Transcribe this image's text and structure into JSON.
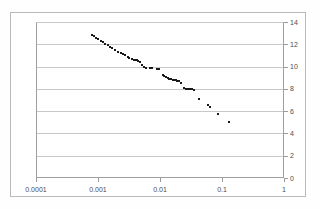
{
  "chart_data": {
    "type": "scatter",
    "title": "",
    "subtitle": "",
    "xlabel": "",
    "ylabel": "",
    "xscale": "log",
    "yscale": "linear",
    "xlim": [
      0.0001,
      1
    ],
    "ylim": [
      0,
      14
    ],
    "grid": "horizontal",
    "legend": null,
    "y_axis_position": "right",
    "x_tick_labels": [
      "0.0001",
      "0.001",
      "0.01",
      "0.1",
      "1"
    ],
    "x_tick_values": [
      0.0001,
      0.001,
      0.01,
      0.1,
      1
    ],
    "y_tick_labels": [
      "0",
      "2",
      "4",
      "6",
      "8",
      "10",
      "12",
      "14"
    ],
    "y_tick_values": [
      0,
      2,
      4,
      6,
      8,
      10,
      12,
      14
    ],
    "marker": {
      "shape": "square",
      "color": "#1a1a1a",
      "size": 2
    },
    "series": [
      {
        "name": "series-1",
        "points": [
          [
            0.00079,
            12.85
          ],
          [
            0.00085,
            12.7
          ],
          [
            0.00093,
            12.55
          ],
          [
            0.001,
            12.45
          ],
          [
            0.0011,
            12.3
          ],
          [
            0.00122,
            12.2
          ],
          [
            0.00132,
            12.05
          ],
          [
            0.00145,
            11.95
          ],
          [
            0.00158,
            11.8
          ],
          [
            0.0017,
            11.7
          ],
          [
            0.0019,
            11.45
          ],
          [
            0.0021,
            11.3
          ],
          [
            0.00232,
            11.2
          ],
          [
            0.0025,
            11.15
          ],
          [
            0.00275,
            11.05
          ],
          [
            0.003,
            10.9
          ],
          [
            0.0032,
            10.75
          ],
          [
            0.00355,
            10.7
          ],
          [
            0.0038,
            10.6
          ],
          [
            0.004,
            10.6
          ],
          [
            0.0042,
            10.55
          ],
          [
            0.0045,
            10.5
          ],
          [
            0.0048,
            10.45
          ],
          [
            0.0052,
            10.1
          ],
          [
            0.0056,
            9.95
          ],
          [
            0.006,
            9.9
          ],
          [
            0.0068,
            9.85
          ],
          [
            0.0074,
            9.85
          ],
          [
            0.0088,
            9.8
          ],
          [
            0.0095,
            9.75
          ],
          [
            0.011,
            9.2
          ],
          [
            0.0118,
            9.15
          ],
          [
            0.0125,
            9.05
          ],
          [
            0.0133,
            9.0
          ],
          [
            0.0142,
            8.9
          ],
          [
            0.015,
            8.85
          ],
          [
            0.0162,
            8.8
          ],
          [
            0.017,
            8.8
          ],
          [
            0.018,
            8.8
          ],
          [
            0.019,
            8.75
          ],
          [
            0.0205,
            8.7
          ],
          [
            0.022,
            8.55
          ],
          [
            0.0245,
            8.1
          ],
          [
            0.026,
            8.0
          ],
          [
            0.028,
            7.95
          ],
          [
            0.0295,
            7.95
          ],
          [
            0.031,
            7.95
          ],
          [
            0.033,
            7.95
          ],
          [
            0.035,
            7.9
          ],
          [
            0.042,
            7.05
          ],
          [
            0.06,
            6.55
          ],
          [
            0.063,
            6.4
          ],
          [
            0.085,
            5.75
          ],
          [
            0.13,
            5.0
          ]
        ]
      }
    ]
  },
  "axes": {
    "x_axis_name": "x-axis-log",
    "y_axis_name": "y-axis-linear"
  }
}
